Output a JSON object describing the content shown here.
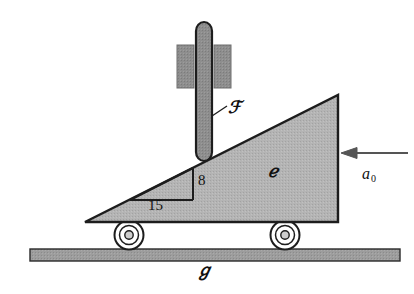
{
  "figure": {
    "background_color": "#ffffff",
    "ink_color": "#1a1a1a",
    "body_fill": "#b0b0b0",
    "rod_fill": "#8c8c8c",
    "guide_fill": "#a8a8a8",
    "ground_fill": "#9a9a9a"
  },
  "labels": {
    "rod": "ℱ",
    "wedge": "ℯ",
    "ground": "ℊ",
    "acceleration": "a",
    "acceleration_subscript": "0",
    "rise": "8",
    "run": "15"
  },
  "geometry": {
    "wedge": {
      "left_apex": [
        85,
        222
      ],
      "top_apex": [
        338,
        95
      ],
      "bottom_right": [
        338,
        222
      ],
      "slope_rise": 8,
      "slope_run": 15
    },
    "rod": {
      "x": 196,
      "top": 22,
      "bottom": 160,
      "width": 16
    },
    "guide_blocks": [
      {
        "x": 178,
        "y": 45,
        "width": 16,
        "height": 42
      },
      {
        "x": 214,
        "y": 45,
        "width": 16,
        "height": 42
      }
    ],
    "wheels": [
      {
        "cx": 129,
        "cy": 235,
        "r": 14
      },
      {
        "cx": 285,
        "cy": 235,
        "r": 14
      }
    ],
    "ground_bar": {
      "x": 30,
      "y": 249,
      "width": 370,
      "height": 12
    },
    "arrow": {
      "from": [
        408,
        153
      ],
      "to": [
        344,
        153
      ],
      "direction": "left"
    }
  }
}
